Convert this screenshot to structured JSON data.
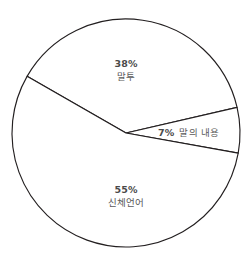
{
  "chart_data": {
    "type": "pie",
    "title": "",
    "subtitle": "",
    "xlabel": "",
    "ylabel": "",
    "legend_position": "none",
    "grid": false,
    "categories": [
      "말투",
      "말의 내용",
      "신체언어"
    ],
    "values": [
      38,
      7,
      55
    ],
    "unit": "%",
    "slices": [
      {
        "label": "말투",
        "value": 38,
        "value_text": "38%",
        "start_angle_deg": 150.2,
        "end_angle_deg": 13.0,
        "fill": "#ffffff",
        "stroke": "#231f20"
      },
      {
        "label": "말의 내용",
        "value": 7,
        "value_text": "7%",
        "start_angle_deg": 13.0,
        "end_angle_deg": -10.2,
        "fill": "#ffffff",
        "stroke": "#231f20"
      },
      {
        "label": "신체언어",
        "value": 55,
        "value_text": "55%",
        "start_angle_deg": -10.2,
        "end_angle_deg": -209.8,
        "fill": "#ffffff",
        "stroke": "#231f20"
      }
    ],
    "geometry": {
      "center_x": 126,
      "center_y": 133,
      "radius": 114
    },
    "colors": {
      "background": "#ffffff",
      "outline": "#231f20",
      "label_value_text": "#4a4a4a",
      "label_name_text": "#5a5a5a"
    }
  },
  "labels": {
    "maltu": {
      "value": "38%",
      "name": "말투"
    },
    "content": {
      "value": "7%",
      "name": "말의 내용"
    },
    "body_language": {
      "value": "55%",
      "name": "신체언어"
    }
  }
}
